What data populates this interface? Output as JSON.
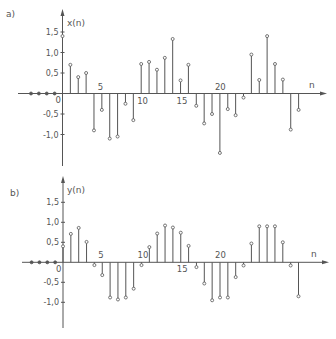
{
  "figure": {
    "panels": [
      {
        "label": "a)",
        "ylabel": "x(n)",
        "xlabel": "n"
      },
      {
        "label": "b)",
        "ylabel": "y(n)",
        "xlabel": "n"
      }
    ]
  },
  "chart_data": [
    {
      "type": "stem",
      "panel_label": "a)",
      "title": "",
      "xlabel": "n",
      "ylabel": "x(n)",
      "x": [
        -4,
        -3,
        -2,
        -1,
        0,
        1,
        2,
        3,
        4,
        5,
        6,
        7,
        8,
        9,
        10,
        11,
        12,
        13,
        14,
        15,
        16,
        17,
        18,
        19,
        20,
        21,
        22,
        23,
        24,
        25,
        26,
        27,
        28,
        29,
        30
      ],
      "values": [
        0,
        0,
        0,
        0,
        1.4,
        0.7,
        0.4,
        0.5,
        -0.9,
        -0.4,
        -1.1,
        -1.05,
        -0.25,
        -0.65,
        0.72,
        0.77,
        0.58,
        0.87,
        1.33,
        0.32,
        0.7,
        -0.3,
        -0.73,
        -0.5,
        -1.45,
        -0.38,
        -0.53,
        -0.1,
        0.95,
        0.33,
        1.4,
        0.72,
        0.34,
        -0.88,
        -0.4
      ],
      "x_ticks": [
        0,
        5,
        10,
        15,
        20
      ],
      "x_tick_labels": [
        "0",
        "5",
        "10",
        "15",
        "20"
      ],
      "y_ticks": [
        1.5,
        1.0,
        0.5,
        -0.5,
        -1.0
      ],
      "y_tick_labels": [
        "1,5",
        "1,0",
        "0,5",
        "-0,5",
        "-1,0"
      ],
      "ylim": [
        -1.75,
        2.0
      ],
      "grid": false,
      "legend": null
    },
    {
      "type": "stem",
      "panel_label": "b)",
      "title": "",
      "xlabel": "n",
      "ylabel": "y(n)",
      "x": [
        -4,
        -3,
        -2,
        -1,
        0,
        1,
        2,
        3,
        4,
        5,
        6,
        7,
        8,
        9,
        10,
        11,
        12,
        13,
        14,
        15,
        16,
        17,
        18,
        19,
        20,
        21,
        22,
        23,
        24,
        25,
        26,
        27,
        28,
        29,
        30
      ],
      "values": [
        0,
        0,
        0,
        0,
        0.4,
        0.71,
        0.86,
        0.51,
        -0.07,
        -0.32,
        -0.88,
        -0.93,
        -0.88,
        -0.66,
        -0.07,
        0.38,
        0.72,
        0.92,
        0.87,
        0.74,
        0.41,
        -0.12,
        -0.53,
        -0.95,
        -0.88,
        -0.88,
        -0.37,
        -0.08,
        0.47,
        0.9,
        0.9,
        0.9,
        0.5,
        -0.08,
        -0.85
      ],
      "x_ticks": [
        0,
        5,
        10,
        15,
        20
      ],
      "x_tick_labels": [
        "0",
        "5",
        "10",
        "15",
        "20"
      ],
      "y_ticks": [
        1.5,
        1.0,
        0.5,
        -0.5,
        -1.0
      ],
      "y_tick_labels": [
        "1,5",
        "1,0",
        "0,5",
        "-0,5",
        "-1,0"
      ],
      "ylim": [
        -1.65,
        2.0
      ],
      "grid": false,
      "legend": null
    }
  ]
}
